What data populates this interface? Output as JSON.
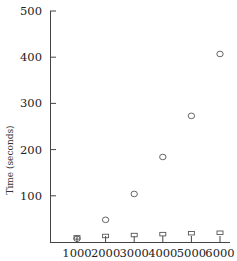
{
  "chart_data": {
    "type": "scatter",
    "title": "",
    "xlabel": "",
    "ylabel": "Time (seconds)",
    "x": [
      1000,
      2000,
      3000,
      4000,
      5000,
      6000
    ],
    "series": [
      {
        "name": "circles",
        "marker": "circle",
        "values": [
          7,
          48,
          104,
          184,
          273,
          407
        ]
      },
      {
        "name": "squares",
        "marker": "square",
        "values": [
          3,
          6,
          8,
          10,
          12,
          13
        ]
      }
    ],
    "x_ticks": [
      "1000",
      "2000",
      "3000",
      "4000",
      "5000",
      "6000"
    ],
    "y_ticks": [
      "100",
      "200",
      "300",
      "400",
      "500"
    ],
    "ylim": [
      0,
      500
    ],
    "xlim": [
      500,
      6300
    ],
    "grid": false,
    "legend": "none"
  }
}
